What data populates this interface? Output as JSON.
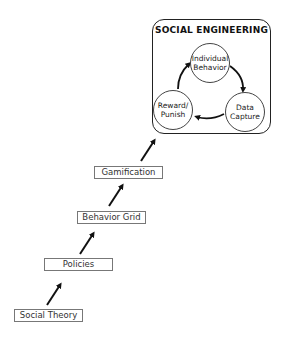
{
  "diagram": {
    "type": "ladder-to-cycle",
    "steps": [
      {
        "label": "Social Theory"
      },
      {
        "label": "Policies"
      },
      {
        "label": "Behavior Grid"
      },
      {
        "label": "Gamification"
      }
    ],
    "cycle": {
      "title": "SOCIAL ENGINEERING",
      "nodes": [
        {
          "line1": "Individual",
          "line2": "Behavior"
        },
        {
          "line1": "Data",
          "line2": "Capture"
        },
        {
          "line1": "Reward/",
          "line2": "Punish"
        }
      ],
      "direction": "clockwise"
    }
  },
  "colors": {
    "arrow": "#111111",
    "box_border": "#777777",
    "cycle_border": "#222222"
  }
}
